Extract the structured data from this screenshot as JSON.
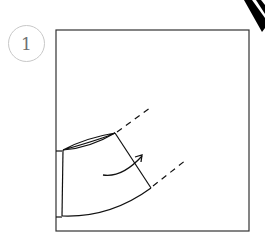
{
  "step": {
    "number": "1"
  },
  "diagram": {
    "colors": {
      "line": "#1a1a1a",
      "circle": "#c8c8c8",
      "number": "#707070",
      "background": "#ffffff"
    }
  }
}
